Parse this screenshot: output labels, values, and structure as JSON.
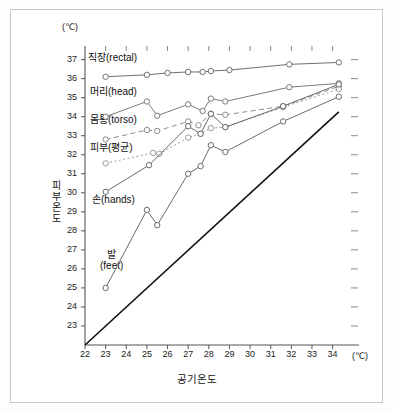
{
  "chart_data": {
    "type": "line",
    "title": "",
    "xlabel": "공기온도",
    "ylabel": "피부온도",
    "x_unit": "(℃)",
    "y_unit": "(℃)",
    "xlim": [
      22,
      34.6
    ],
    "ylim": [
      22,
      37.4
    ],
    "xticks": [
      22,
      23,
      24,
      25,
      26,
      27,
      28,
      29,
      30,
      31,
      32,
      33,
      34
    ],
    "yticks": [
      23,
      24,
      25,
      26,
      27,
      28,
      29,
      30,
      31,
      32,
      33,
      34,
      35,
      36,
      37
    ],
    "grid": false,
    "legend": "inline-labels",
    "series": [
      {
        "name": "직장(rectal)",
        "label": "직장(rectal)",
        "style": "solid",
        "color": "#6f6f6f",
        "marker": "open-circle",
        "x": [
          23.0,
          25.0,
          26.0,
          27.0,
          27.7,
          28.1,
          29.0,
          31.9,
          34.3
        ],
        "y": [
          36.1,
          36.2,
          36.3,
          36.35,
          36.35,
          36.4,
          36.45,
          36.75,
          36.85
        ]
      },
      {
        "name": "머리(head)",
        "label": "머리(head)",
        "style": "solid",
        "color": "#7a7a7a",
        "marker": "open-circle",
        "x": [
          23.0,
          25.0,
          25.5,
          27.0,
          27.7,
          28.1,
          28.8,
          31.9,
          34.3
        ],
        "y": [
          34.0,
          34.8,
          34.05,
          34.65,
          34.3,
          34.95,
          34.8,
          35.55,
          35.75
        ]
      },
      {
        "name": "몸통(torso)",
        "label": "몸통(torso)",
        "style": "dashed",
        "color": "#8a8a8a",
        "marker": "open-circle",
        "x": [
          23.0,
          25.0,
          25.5,
          27.0,
          27.5,
          28.1,
          28.8,
          31.6,
          34.3
        ],
        "y": [
          32.8,
          33.3,
          33.25,
          33.75,
          33.55,
          34.15,
          34.1,
          34.55,
          35.6
        ]
      },
      {
        "name": "피부(평균)",
        "label": "피부(평균)",
        "style": "dotted",
        "color": "#9a9a9a",
        "marker": "open-circle",
        "x": [
          23.0,
          25.3,
          25.6,
          27.0,
          27.6,
          28.1,
          28.8,
          31.6,
          34.3
        ],
        "y": [
          31.55,
          32.1,
          32.05,
          32.9,
          33.1,
          33.4,
          33.45,
          34.5,
          35.45
        ]
      },
      {
        "name": "손(hands)",
        "label": "손(hands)",
        "style": "solid",
        "color": "#6a6a6a",
        "marker": "open-circle",
        "x": [
          23.0,
          25.1,
          27.0,
          27.6,
          28.1,
          28.8,
          31.6,
          34.3
        ],
        "y": [
          30.05,
          31.45,
          33.5,
          33.1,
          34.15,
          33.45,
          34.55,
          35.7
        ]
      },
      {
        "name": "발(feet)",
        "label": "발\n(feet)",
        "style": "solid",
        "color": "#6a6a6a",
        "marker": "open-circle",
        "x": [
          23.0,
          25.0,
          25.5,
          27.0,
          27.6,
          28.1,
          28.8,
          31.6,
          34.3
        ],
        "y": [
          25.0,
          29.1,
          28.3,
          31.0,
          31.4,
          32.5,
          32.15,
          33.75,
          35.05
        ]
      },
      {
        "name": "기준선(y=x)",
        "label": "",
        "style": "solid-black",
        "color": "#111111",
        "marker": "none",
        "x": [
          22.0,
          34.3
        ],
        "y": [
          22.0,
          34.25
        ]
      }
    ],
    "series_labels": [
      {
        "name": "직장(rectal)",
        "text": "직장(rectal)",
        "x_px": 88,
        "y_px": 53
      },
      {
        "name": "머리(head)",
        "text": "머리(head)",
        "x_px": 90,
        "y_px": 87
      },
      {
        "name": "몸통(torso)",
        "text": "몸통(torso)",
        "x_px": 90,
        "y_px": 115
      },
      {
        "name": "피부(평균)",
        "text": "피부(평균)",
        "x_px": 90,
        "y_px": 143
      },
      {
        "name": "손(hands)",
        "text": "손(hands)",
        "x_px": 92,
        "y_px": 195
      },
      {
        "name": "발(feet)",
        "text": "발",
        "text2": "(feet)",
        "x_px": 100,
        "y_px": 250
      }
    ]
  },
  "axis": {
    "y_unit_label": "(℃)",
    "x_unit_label": "(℃)",
    "y_title": "피부온도",
    "x_title": "공기온도"
  }
}
